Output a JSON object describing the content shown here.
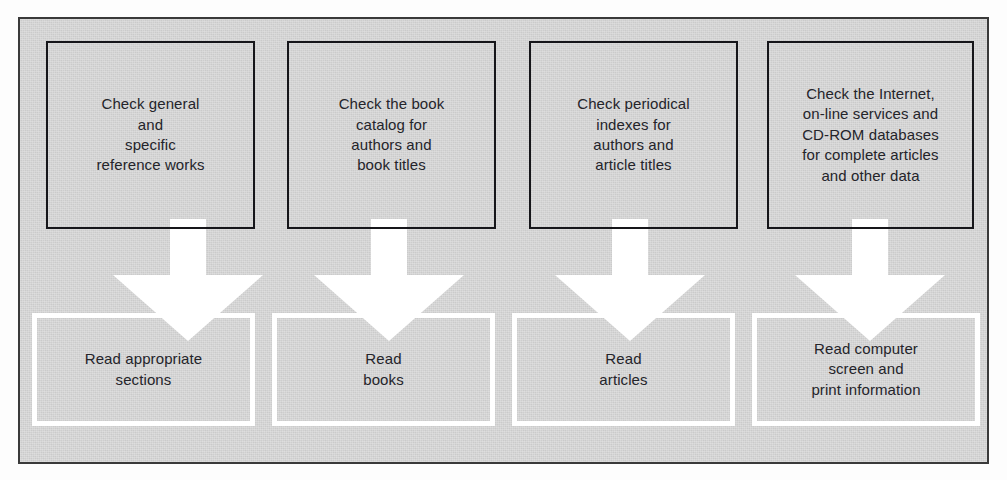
{
  "diagram": {
    "background_color": "#d2d2d2",
    "frame_border_color": "#3a3a3a",
    "top_box_border_color": "#16161a",
    "bottom_box_border_color": "#ffffff",
    "arrow_color": "#ffffff",
    "text_color": "#24242a"
  },
  "top_row": [
    {
      "id": "reference-works",
      "text": "Check general\nand\nspecific\nreference works"
    },
    {
      "id": "book-catalog",
      "text": "Check the book\ncatalog for\nauthors and\nbook titles"
    },
    {
      "id": "periodical-indexes",
      "text": "Check periodical\nindexes for\nauthors and\narticle titles"
    },
    {
      "id": "internet-databases",
      "text": "Check the Internet,\non-line services and\nCD-ROM databases\nfor complete articles\nand other data"
    }
  ],
  "arrows": [
    {
      "id": "arrow-to-read-sections",
      "direction": "down"
    },
    {
      "id": "arrow-to-read-books",
      "direction": "down"
    },
    {
      "id": "arrow-to-read-articles",
      "direction": "down"
    },
    {
      "id": "arrow-to-read-computer-screen",
      "direction": "down"
    }
  ],
  "bottom_row": [
    {
      "id": "read-sections",
      "text": "Read appropriate\nsections"
    },
    {
      "id": "read-books",
      "text": "Read\nbooks"
    },
    {
      "id": "read-articles",
      "text": "Read\narticles"
    },
    {
      "id": "read-computer-screen",
      "text": "Read computer\nscreen and\nprint information"
    }
  ]
}
